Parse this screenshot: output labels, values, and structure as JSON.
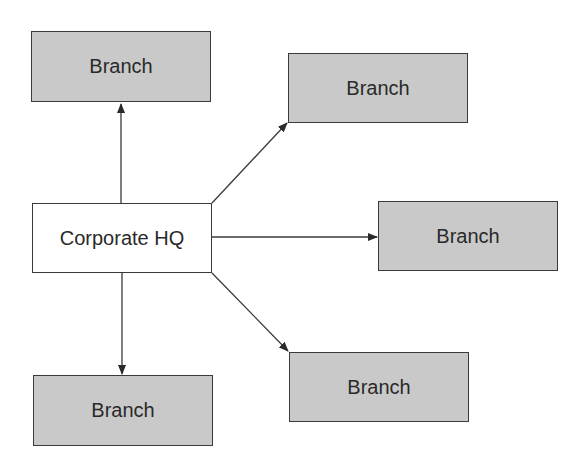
{
  "diagram": {
    "hq": {
      "label": "Corporate HQ"
    },
    "branches": [
      {
        "label": "Branch",
        "position": "top-left"
      },
      {
        "label": "Branch",
        "position": "top-right"
      },
      {
        "label": "Branch",
        "position": "middle-right"
      },
      {
        "label": "Branch",
        "position": "bottom-right"
      },
      {
        "label": "Branch",
        "position": "bottom-left"
      }
    ],
    "colors": {
      "branch_fill": "#c9c9c9",
      "hq_fill": "#ffffff",
      "stroke": "#3a3a3a",
      "text": "#2a2a2a"
    }
  }
}
